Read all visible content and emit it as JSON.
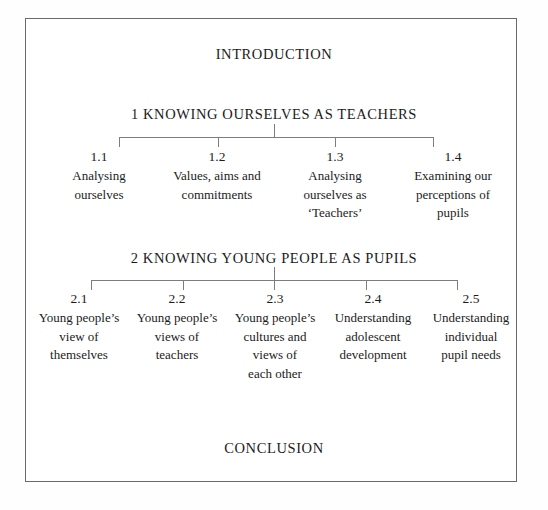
{
  "diagram": {
    "title_top": "INTRODUCTION",
    "title_bottom": "CONCLUSION",
    "frame_color": "#6a6a6a",
    "line_color": "#7d7d7d",
    "text_color": "#1b1b1b",
    "sections": [
      {
        "heading": "1  KNOWING OURSELVES AS TEACHERS",
        "children": [
          {
            "number": "1.1",
            "label": "Analysing\nourselves"
          },
          {
            "number": "1.2",
            "label": "Values, aims and\ncommitments"
          },
          {
            "number": "1.3",
            "label": "Analysing\nourselves as\n‘Teachers’"
          },
          {
            "number": "1.4",
            "label": "Examining our\nperceptions of\npupils"
          }
        ]
      },
      {
        "heading": "2  KNOWING YOUNG PEOPLE AS PUPILS",
        "children": [
          {
            "number": "2.1",
            "label": "Young people’s\nview of\nthemselves"
          },
          {
            "number": "2.2",
            "label": "Young people’s\nviews of\nteachers"
          },
          {
            "number": "2.3",
            "label": "Young people’s\ncultures and\nviews of\neach other"
          },
          {
            "number": "2.4",
            "label": "Understanding\nadolescent\ndevelopment"
          },
          {
            "number": "2.5",
            "label": "Understanding\nindividual\npupil needs"
          }
        ]
      }
    ]
  }
}
